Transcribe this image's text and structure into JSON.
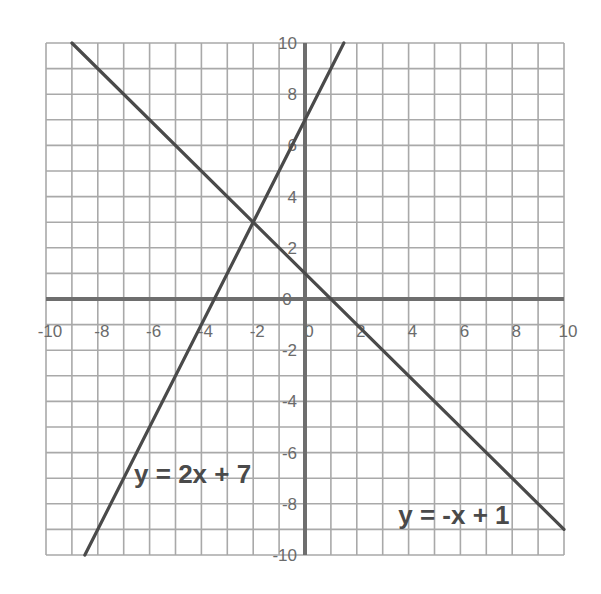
{
  "chart_data": {
    "type": "line",
    "title": "",
    "xlabel": "",
    "ylabel": "",
    "xlim": [
      -10,
      10
    ],
    "ylim": [
      -10,
      10
    ],
    "grid": true,
    "grid_step": 1,
    "x_ticks": [
      -10,
      -8,
      -6,
      -4,
      -2,
      0,
      2,
      4,
      6,
      8,
      10
    ],
    "y_ticks": [
      10,
      8,
      6,
      4,
      2,
      0,
      -2,
      -4,
      -6,
      -8,
      -10
    ],
    "x_tick_labels": [
      "-10",
      "-8",
      "-6",
      "-4",
      "-2",
      "0",
      "2",
      "4",
      "6",
      "8",
      "10"
    ],
    "y_tick_labels": [
      "10",
      "8",
      "6",
      "4",
      "2",
      "0",
      "-2",
      "-4",
      "-6",
      "-8",
      "-10"
    ],
    "series": [
      {
        "name": "y = 2x + 7",
        "slope": 2,
        "intercept": 7,
        "points": [
          [
            -8.5,
            -10
          ],
          [
            1.5,
            10
          ]
        ],
        "label_pos": [
          -6.6,
          -7.2
        ]
      },
      {
        "name": "y = -x + 1",
        "slope": -1,
        "intercept": 1,
        "points": [
          [
            -9,
            10
          ],
          [
            10,
            -9
          ]
        ],
        "label_pos": [
          3.6,
          -8.8
        ]
      }
    ],
    "intersection": [
      -2,
      3
    ],
    "colors": {
      "grid": "#a9a9a9",
      "axis": "#6e6e6e",
      "line": "#4a4a4a",
      "tick_text": "#6b6b6b"
    }
  }
}
